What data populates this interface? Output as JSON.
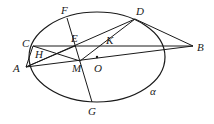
{
  "figure": {
    "stroke_color": "#1a1a1a",
    "background": "#ffffff",
    "ellipse": {
      "label": "α",
      "cx": 97,
      "cy": 57,
      "rx": 68,
      "ry": 45
    },
    "points": [
      {
        "name": "A",
        "x": 26,
        "y": 67,
        "label_x": 13,
        "label_y": 72
      },
      {
        "name": "B",
        "x": 193,
        "y": 46,
        "label_x": 197,
        "label_y": 51
      },
      {
        "name": "C",
        "x": 33,
        "y": 46,
        "label_x": 22,
        "label_y": 47
      },
      {
        "name": "D",
        "x": 135,
        "y": 19,
        "label_x": 136,
        "label_y": 15
      },
      {
        "name": "E",
        "x": 75,
        "y": 46,
        "label_x": 71,
        "label_y": 42
      },
      {
        "name": "F",
        "x": 67,
        "y": 18,
        "label_x": 61,
        "label_y": 14
      },
      {
        "name": "G",
        "x": 92,
        "y": 102,
        "label_x": 88,
        "label_y": 115
      },
      {
        "name": "H",
        "x": 44,
        "y": 54,
        "label_x": 35,
        "label_y": 58
      },
      {
        "name": "K",
        "x": 108,
        "y": 46,
        "label_x": 106,
        "label_y": 44
      },
      {
        "name": "M",
        "x": 80,
        "y": 61,
        "label_x": 72,
        "label_y": 72
      },
      {
        "name": "O",
        "x": 97,
        "y": 57,
        "label_x": 94,
        "label_y": 72
      }
    ],
    "segments": [
      "AC",
      "AB",
      "CB",
      "DB",
      "AD",
      "CM",
      "DM",
      "FG",
      "AE"
    ],
    "alpha_label": {
      "text": "α",
      "x": 150,
      "y": 95
    }
  }
}
